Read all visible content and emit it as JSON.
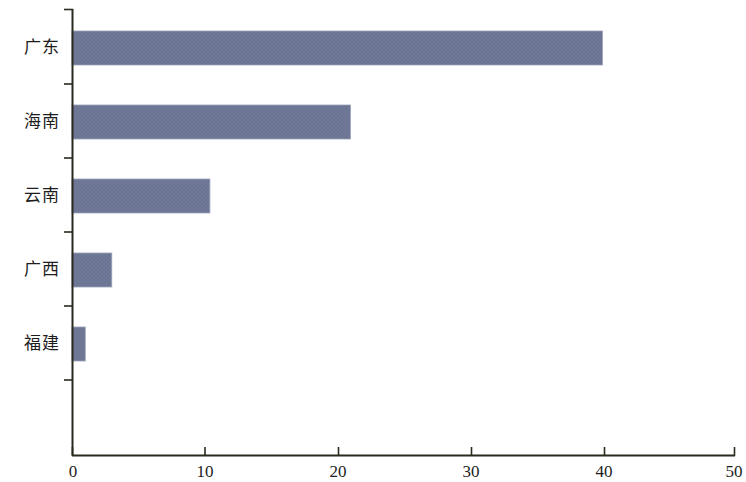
{
  "chart_data": {
    "type": "bar",
    "orientation": "horizontal",
    "title": "",
    "subtitle": "",
    "xlabel": "",
    "ylabel": "",
    "categories": [
      "广东",
      "海南",
      "云南",
      "广西",
      "福建"
    ],
    "values": [
      40,
      21,
      10.4,
      3,
      1
    ],
    "series": [
      {
        "name": "",
        "values": [
          40,
          21,
          10.4,
          3,
          1
        ],
        "color": "#6b7593"
      }
    ],
    "xlim": [
      0,
      50
    ],
    "xticks": [
      0,
      10,
      20,
      30,
      40,
      50
    ],
    "xtick_labels": [
      "0",
      "10",
      "20",
      "30",
      "40",
      "50"
    ],
    "ytick_labels": [
      "广东",
      "海南",
      "云南",
      "广西",
      "福建"
    ],
    "grid": false,
    "legend": false,
    "legend_position": "none",
    "bar_color": "#6b7593",
    "axis_color": "#2b2a20",
    "background_color": "#ffffff",
    "annotations": []
  },
  "bars": [
    {
      "label": "广东",
      "value": 40
    },
    {
      "label": "海南",
      "value": 21
    },
    {
      "label": "云南",
      "value": 10.4
    },
    {
      "label": "广西",
      "value": 3
    },
    {
      "label": "福建",
      "value": 1
    }
  ],
  "axis": {
    "x_tick_0": "0",
    "x_tick_1": "10",
    "x_tick_2": "20",
    "x_tick_3": "30",
    "x_tick_4": "40",
    "x_tick_5": "50"
  }
}
